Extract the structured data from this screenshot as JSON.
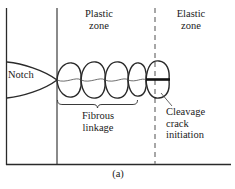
{
  "figure": {
    "caption": "(a)",
    "labels": {
      "plastic_zone": "Plastic\nzone",
      "elastic_zone": "Elastic\nzone",
      "notch": "Notch",
      "fibrous_linkage": "Fibrous\nlinkage",
      "cleavage_crack_initiation": "Cleavage\ncrack\ninitiation"
    },
    "colors": {
      "ink": "#1b1b1b",
      "line": "#2a2a2a",
      "dashed": "#8a8a8a",
      "background": "#ffffff"
    },
    "geometry": {
      "frame_left_x": 6,
      "frame_top_y": 8,
      "frame_bottom_y": 165,
      "frame_right_x": 231,
      "plastic_zone_boundary_x": 57,
      "elastic_zone_boundary_x": 155,
      "void_chain_center_y": 80,
      "void_count": 5,
      "brace_start_x": 57,
      "brace_end_x": 138,
      "brace_y": 103
    }
  }
}
